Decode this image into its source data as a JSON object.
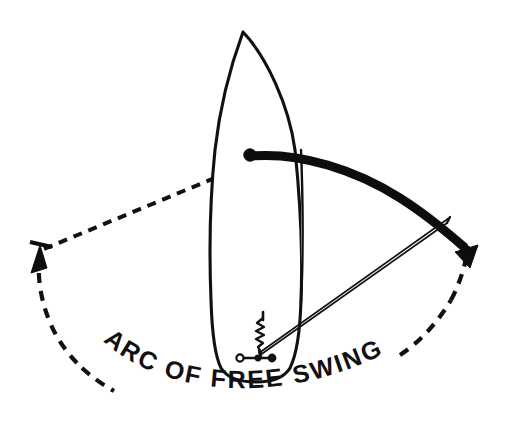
{
  "figure": {
    "background_color": "#ffffff",
    "ink_color": "#111111",
    "width": 513,
    "height": 431
  },
  "labels": {
    "arc_caption": "ARC OF FREE SWING",
    "arc_caption_words": [
      "ARC",
      "OF",
      "FREE",
      "SWING"
    ]
  },
  "elements": {
    "hull": {
      "name": "boat-hull",
      "description": "plan view of vessel hull, pointed bow at top, transom at bottom"
    },
    "pivot": {
      "name": "bow-pivot-point",
      "description": "solid dot at bow roller where rode leaves the vessel"
    },
    "swing_arc": {
      "name": "swing-arc",
      "description": "heavy arc showing swept path of the bow",
      "stroke_color": "#0d0d0d"
    },
    "rode": {
      "name": "anchor-rode",
      "description": "double line from windlass aft leading out to the anchor"
    },
    "windlass": {
      "name": "windlass-and-cleat",
      "description": "coiled chain with cleat on deck"
    },
    "dashed_swing_circle": {
      "name": "dashed-swing-circle",
      "description": "dashed circle of the full swinging radius"
    },
    "dashed_radius": {
      "name": "dashed-radius-line",
      "description": "dashed radius from the left limit of swing toward the pivot"
    },
    "arrow_left": {
      "name": "left-swing-arrowhead",
      "description": "arrowhead at the port limit of the swing"
    },
    "arrow_right": {
      "name": "right-swing-arrowhead",
      "description": "arrowhead at the starboard limit of the swing"
    }
  }
}
